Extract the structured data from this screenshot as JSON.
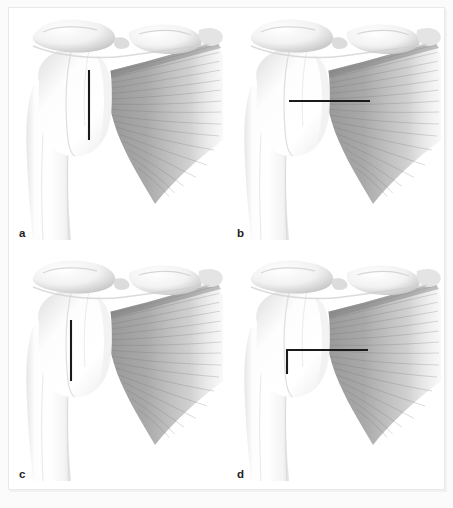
{
  "figure": {
    "type": "medical-illustration",
    "panel_count": 4,
    "layout": "2x2 grid",
    "background_color": "#ffffff",
    "frame_color": "#e9e9e9",
    "marker_color": "#1a1a1a"
  },
  "panels": [
    {
      "label": "a",
      "marker": {
        "shape": "vertical-line",
        "description": "vertical line at lateral tendon insertion",
        "x1": 80,
        "y1": 62,
        "x2": 80,
        "y2": 132
      }
    },
    {
      "label": "b",
      "marker": {
        "shape": "horizontal-line",
        "description": "horizontal line running laterally through muscle belly",
        "x1": 62,
        "y1": 93,
        "x2": 143,
        "y2": 93
      }
    },
    {
      "label": "c",
      "marker": {
        "shape": "vertical-line",
        "description": "vertical line positioned medially on the humeral head",
        "x1": 62,
        "y1": 71,
        "x2": 62,
        "y2": 132
      }
    },
    {
      "label": "d",
      "marker": {
        "shape": "L-shaped-line",
        "description": "L-shaped line: horizontal segment with descending vertical limb",
        "x1": 60,
        "y1": 101,
        "x2": 141,
        "y2": 101,
        "vx": 60,
        "vy1": 101,
        "vy2": 125
      }
    }
  ],
  "anatomy": {
    "structures": [
      "acromion",
      "acromioclavicular joint",
      "clavicle",
      "coracoid process",
      "humeral head",
      "greater tuberosity",
      "humeral shaft",
      "rotator cuff tendon",
      "rotator cuff muscle fibers"
    ]
  }
}
